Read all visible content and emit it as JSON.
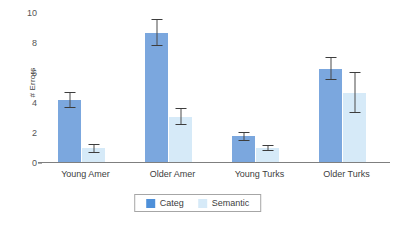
{
  "chart_data": {
    "type": "bar",
    "title": "",
    "xlabel": "",
    "ylabel": "# Errors",
    "ylim": [
      0,
      10
    ],
    "yticks": [
      0,
      2,
      4,
      6,
      8,
      10
    ],
    "grid": false,
    "legend_position": "bottom-center",
    "categories": [
      "Young Amer",
      "Older Amer",
      "Young Turks",
      "Older Turks"
    ],
    "series": [
      {
        "name": "Categ",
        "color": "#7BA7DE",
        "legend_swatch_color": "#4E90D9",
        "values": [
          4.2,
          8.7,
          1.8,
          6.3
        ],
        "errors": [
          0.55,
          0.9,
          0.3,
          0.75
        ]
      },
      {
        "name": "Semantic",
        "color": "#D6EAF8",
        "legend_swatch_color": "#D6EAF8",
        "values": [
          1.0,
          3.1,
          1.0,
          4.7
        ],
        "errors": [
          0.3,
          0.55,
          0.2,
          1.35
        ]
      }
    ]
  },
  "axis": {
    "y_title": "# Errors",
    "y_tick_labels": [
      "0",
      "2",
      "4",
      "6",
      "8",
      "10"
    ]
  },
  "legend": {
    "entries": [
      {
        "label": "Categ",
        "icon": "legend-swatch-categ"
      },
      {
        "label": "Semantic",
        "icon": "legend-swatch-semantic"
      }
    ]
  }
}
